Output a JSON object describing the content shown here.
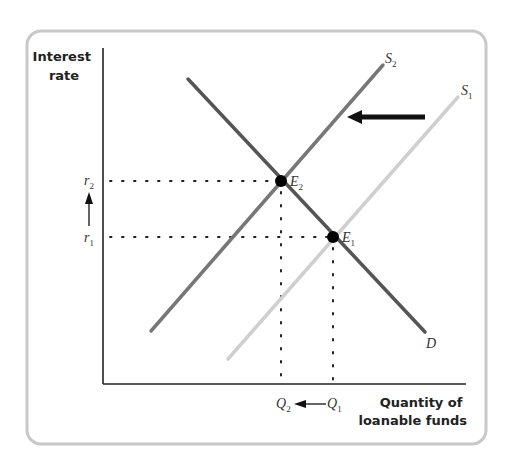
{
  "diagram": {
    "type": "supply-demand",
    "market": "loanable funds",
    "axes": {
      "y_label_line1": "Interest",
      "y_label_line2": "rate",
      "x_label_line1": "Quantity of",
      "x_label_line2": "loanable funds"
    },
    "curves": {
      "demand": {
        "label": "D",
        "color": "#555555"
      },
      "supply_new": {
        "label": "S",
        "sub": "2",
        "color": "#777777"
      },
      "supply_old": {
        "label": "S",
        "sub": "1",
        "color": "#cfcfcf"
      }
    },
    "equilibria": {
      "e2": {
        "label": "E",
        "sub": "2"
      },
      "e1": {
        "label": "E",
        "sub": "1"
      }
    },
    "y_ticks": {
      "r2": {
        "label": "r",
        "sub": "2"
      },
      "r1": {
        "label": "r",
        "sub": "1"
      }
    },
    "x_ticks": {
      "q2": {
        "label": "Q",
        "sub": "2"
      },
      "q1": {
        "label": "Q",
        "sub": "1"
      }
    },
    "annotations": {
      "supply_shift": "leftward shift of supply from S1 to S2",
      "rate_change": "interest rate rises from r1 to r2",
      "quantity_change": "quantity falls from Q1 to Q2"
    },
    "colors": {
      "frame": "#c8c8c8",
      "axis": "#222222",
      "arrow": "#111111",
      "dot": "#000000"
    }
  }
}
